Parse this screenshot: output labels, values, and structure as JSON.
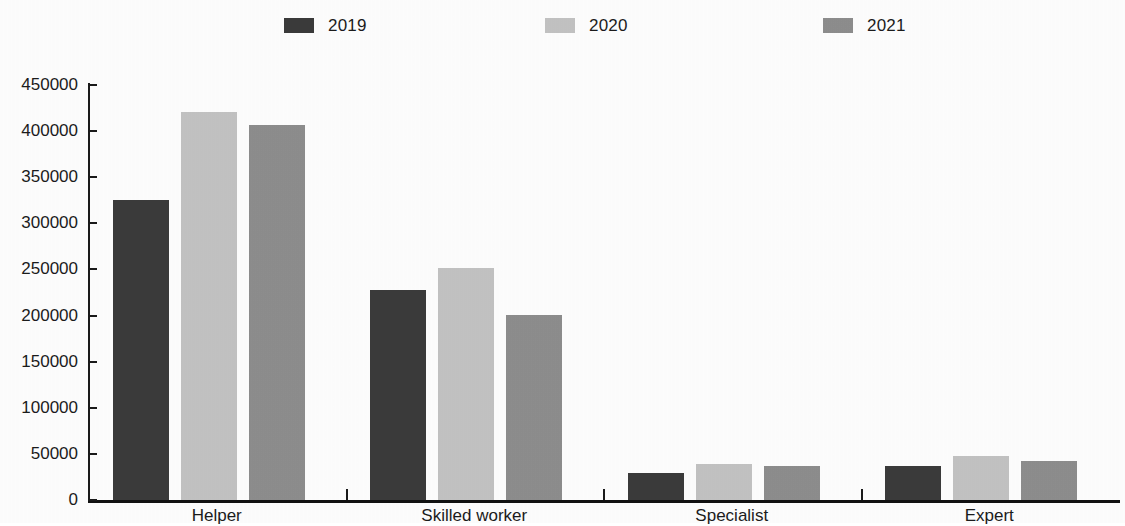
{
  "legend": {
    "position": "top-center",
    "entries": [
      {
        "label": "2019",
        "color": "#3a3a3a",
        "icon": "legend-swatch-icon"
      },
      {
        "label": "2020",
        "color": "#c2c2c2",
        "icon": "legend-swatch-icon"
      },
      {
        "label": "2021",
        "color": "#8d8d8d",
        "icon": "legend-swatch-icon"
      }
    ]
  },
  "axes": {
    "y_ticks": [
      "450000",
      "400000",
      "350000",
      "300000",
      "250000",
      "200000",
      "150000",
      "100000",
      "50000",
      "0"
    ],
    "x_categories": [
      "Helper",
      "Skilled worker",
      "Specialist",
      "Expert"
    ]
  },
  "chart_data": {
    "type": "bar",
    "title": "",
    "subtitle": "",
    "xlabel": "",
    "ylabel": "",
    "ylim": [
      0,
      450000
    ],
    "ytick_step": 50000,
    "grid": false,
    "legend_position": "top-center",
    "categories": [
      "Helper",
      "Skilled worker",
      "Specialist",
      "Expert"
    ],
    "series": [
      {
        "name": "2019",
        "color": "#3a3a3a",
        "values": [
          325000,
          228000,
          29000,
          37000
        ]
      },
      {
        "name": "2020",
        "color": "#c2c2c2",
        "values": [
          421000,
          252000,
          39000,
          48000
        ]
      },
      {
        "name": "2021",
        "color": "#8d8d8d",
        "values": [
          407000,
          201000,
          37000,
          42000
        ]
      }
    ]
  }
}
